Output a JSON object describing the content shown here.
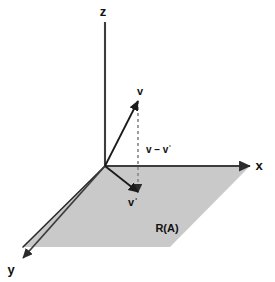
{
  "figure": {
    "background_color": "#ffffff",
    "axis_color": "#3d3d3d",
    "vector_color": "#1a1a1a",
    "dashed_color": "#8c8c8c",
    "plane_fill_color": "#c9c9c9",
    "plane_edge_color": "#2b2b2b",
    "label_color": "#111111"
  },
  "axes": [
    {
      "id": "z",
      "label": "z",
      "label_x": 103,
      "label_y": 16,
      "from_x": 105,
      "from_y": 166,
      "to_x": 105,
      "to_y": 22
    },
    {
      "id": "x",
      "label": "x",
      "label_x": 259,
      "label_y": 170,
      "from_x": 105,
      "from_y": 166,
      "to_x": 250,
      "to_y": 166
    },
    {
      "id": "y",
      "label": "y",
      "label_x": 11,
      "label_y": 274,
      "from_x": 105,
      "from_y": 166,
      "to_x": 23,
      "to_y": 258
    }
  ],
  "vectors": [
    {
      "id": "v",
      "label": "v",
      "label_x": 140,
      "label_y": 95,
      "from_x": 105,
      "from_y": 166,
      "to_x": 138,
      "to_y": 101
    },
    {
      "id": "v-prime",
      "label": "vˈ",
      "label_x": 133,
      "label_y": 206,
      "from_x": 105,
      "from_y": 166,
      "to_x": 138,
      "to_y": 192
    }
  ],
  "dashed_segment": {
    "id": "v-minus-v-prime",
    "label": "v – vˈ",
    "label_x": 146,
    "label_y": 153,
    "from_x": 138,
    "from_y": 101,
    "to_x": 138,
    "to_y": 192
  },
  "plane": {
    "id": "range-plane",
    "label": "R(A)",
    "label_x": 167,
    "label_y": 232,
    "points": "23,247 105,166 250,166 170,247",
    "corners": [
      {
        "x": 23,
        "y": 247
      },
      {
        "x": 105,
        "y": 166
      },
      {
        "x": 250,
        "y": 166
      },
      {
        "x": 170,
        "y": 247
      }
    ]
  }
}
